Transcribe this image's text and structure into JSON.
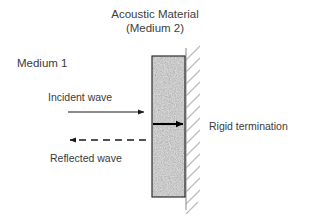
{
  "figure": {
    "title_line1": "Acoustic Material",
    "title_line2": "(Medium 2)",
    "background_color": "#ffffff",
    "text_color": "#3a3a3a"
  },
  "labels": {
    "medium1": "Medium 1",
    "incident_wave": "Incident wave",
    "reflected_wave": "Reflected wave",
    "rigid_termination": "Rigid termination"
  },
  "elements": {
    "material_block": {
      "name": "Acoustic Material (Medium 2)",
      "fill_description": "speckled gray noise texture",
      "fill_color": "#8e8e8e",
      "border_color": "#2b2b2b",
      "x": 152,
      "y": 56,
      "width": 33,
      "height": 141
    },
    "rigid_wall": {
      "name": "Rigid termination",
      "line_color": "#9a9a9a",
      "hatch_color": "#b5b5b5",
      "x": 186,
      "y_top": 48,
      "y_bottom": 210,
      "hatch_count": 14
    },
    "incident_arrow": {
      "name": "Incident wave arrow",
      "style": "solid",
      "direction": "right",
      "color": "#1a1a1a",
      "x1": 68,
      "x2": 146,
      "y": 112
    },
    "reflected_arrow": {
      "name": "Reflected wave arrow",
      "style": "dashed",
      "direction": "left",
      "color": "#1a1a1a",
      "x1": 146,
      "x2": 68,
      "y": 140,
      "dash_count": 7
    },
    "thickness_arrow": {
      "name": "Material thickness arrow",
      "style": "solid-thick",
      "direction": "right",
      "color": "#000000",
      "x1": 153,
      "x2": 185,
      "y": 124
    }
  }
}
